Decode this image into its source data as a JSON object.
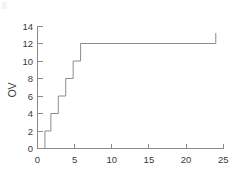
{
  "chart_data": {
    "type": "line",
    "subtype": "step",
    "title": "",
    "subtitle": "",
    "xlabel": "",
    "ylabel": "OV",
    "xlim": [
      0,
      25
    ],
    "ylim": [
      0,
      14
    ],
    "xticks": [
      0,
      5,
      10,
      15,
      20,
      25
    ],
    "yticks": [
      0,
      2,
      4,
      6,
      8,
      10,
      12,
      14
    ],
    "xtick_labels": [
      "0",
      "5",
      "10",
      "15",
      "20",
      "25"
    ],
    "ytick_labels": [
      "0",
      "2",
      "4",
      "6",
      "8",
      "10",
      "12",
      "14"
    ],
    "grid": false,
    "legend": false,
    "legend_position": "none",
    "line_color": "#8c8c8c",
    "axis_color": "#8a8a8a",
    "background_color": "#ffffff",
    "series": [
      {
        "name": "OV",
        "step_mode": "post",
        "x": [
          1.0,
          1.0,
          1.8,
          1.8,
          2.8,
          2.8,
          3.8,
          3.8,
          4.8,
          4.8,
          5.8,
          5.8,
          24.0
        ],
        "y": [
          0,
          2,
          2,
          4,
          4,
          6,
          6,
          8,
          8,
          10,
          10,
          12,
          12
        ],
        "points": [
          {
            "x": 1.0,
            "y": 0
          },
          {
            "x": 1.0,
            "y": 2
          },
          {
            "x": 1.8,
            "y": 2
          },
          {
            "x": 1.8,
            "y": 4
          },
          {
            "x": 2.8,
            "y": 4
          },
          {
            "x": 2.8,
            "y": 6
          },
          {
            "x": 3.8,
            "y": 6
          },
          {
            "x": 3.8,
            "y": 8
          },
          {
            "x": 4.8,
            "y": 8
          },
          {
            "x": 4.8,
            "y": 10
          },
          {
            "x": 5.8,
            "y": 10
          },
          {
            "x": 5.8,
            "y": 12
          },
          {
            "x": 24.0,
            "y": 12
          }
        ]
      }
    ],
    "annotations": [
      {
        "name": "censor-tick",
        "x": 24.0,
        "y_from": 12,
        "y_to": 13.2,
        "description": "short vertical tick at end of plateau"
      }
    ]
  },
  "axes": {
    "y_axis_title": "OV"
  }
}
